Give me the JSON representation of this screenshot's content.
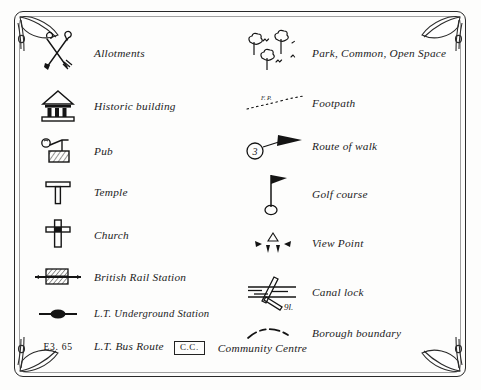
{
  "legend": {
    "title": "Map Legend / Key",
    "left_column": [
      {
        "icon": "crossed-spade-fork-icon",
        "label": "Allotments"
      },
      {
        "icon": "classical-building-icon",
        "label": "Historic building"
      },
      {
        "icon": "beer-pump-icon",
        "label": "Pub"
      },
      {
        "icon": "tau-temple-icon",
        "label": "Temple"
      },
      {
        "icon": "cross-church-icon",
        "label": "Church"
      },
      {
        "icon": "british-rail-station-icon",
        "label": "British Rail Station"
      },
      {
        "icon": "underground-station-icon",
        "label": "L.T. Underground Station"
      },
      {
        "icon": "bus-route-code-icon",
        "label": "L.T. Bus Route",
        "code": "E3. 65"
      }
    ],
    "right_column": [
      {
        "icon": "trees-park-icon",
        "label": "Park, Common, Open Space"
      },
      {
        "icon": "dotted-footpath-icon",
        "label": "Footpath",
        "tag": "F. P."
      },
      {
        "icon": "route-arrow-icon",
        "label": "Route of walk",
        "route_number": "3"
      },
      {
        "icon": "golf-flag-icon",
        "label": "Golf course"
      },
      {
        "icon": "view-point-icon",
        "label": "View Point"
      },
      {
        "icon": "canal-lock-icon",
        "label": "Canal lock",
        "annotation": "9l."
      },
      {
        "icon": "borough-boundary-icon",
        "label": "Borough boundary"
      }
    ],
    "footer": {
      "icon": "community-centre-box-icon",
      "code": "C.C.",
      "label": "Community Centre"
    }
  },
  "style": {
    "ink": "#1a1a1a",
    "paper": "#fdfdfc"
  }
}
